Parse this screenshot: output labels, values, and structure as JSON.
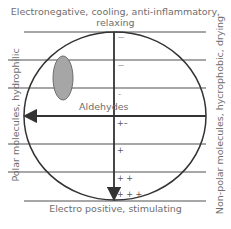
{
  "diagram": {
    "top_label": "Electronegative, cooling, anti-inflammatory, relaxing",
    "bottom_label": "Electro positive, stimulating",
    "left_label": "Polar molecules, hydrophilic",
    "right_label": "Non-polar molecules, hycrophobic, drying",
    "region_label": "Aldehydes",
    "scale_marks": [
      "—",
      "—",
      "–",
      "+–",
      "+",
      "+ +",
      "+ + +"
    ],
    "colors": {
      "circle_stroke": "#333333",
      "grid_line": "#8a8a8a",
      "ellipse_fill": "#a6a6a6",
      "text": "#6e6e6e"
    }
  }
}
